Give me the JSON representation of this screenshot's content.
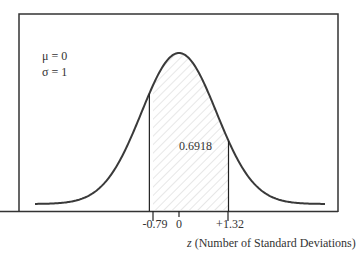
{
  "diagram": {
    "type": "normal_distribution",
    "parameters": {
      "mu_label": "μ = 0",
      "sigma_label": "σ = 1"
    },
    "shaded_area_label": "0.6918",
    "shaded_range": {
      "from": -0.79,
      "to": 1.32
    },
    "ticks": [
      {
        "label": "-0.79",
        "value": -0.79
      },
      {
        "label": "0",
        "value": 0
      },
      {
        "label": "+1.32",
        "value": 1.32
      }
    ],
    "axis_title_var": "z",
    "axis_title_rest": " (Number of Standard Deviations)",
    "colors": {
      "curve": "#3a3a3a",
      "hatch": "#c8c8c8",
      "frame": "#333333"
    }
  }
}
